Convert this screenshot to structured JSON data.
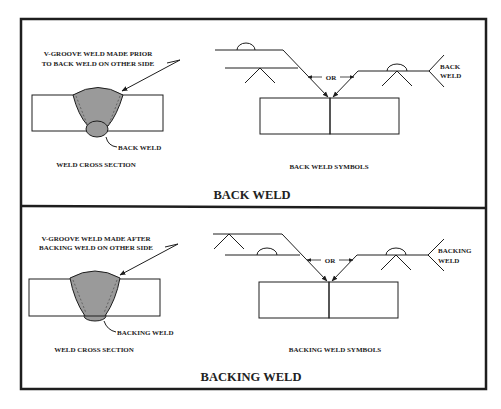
{
  "colors": {
    "line": "#1e1e1e",
    "weld_fill": "#9a9a9a",
    "background": "#ffffff"
  },
  "panels": [
    {
      "title": "BACK WELD",
      "cross_section": {
        "callout_line1": "V-GROOVE WELD MADE PRIOR",
        "callout_line2": "TO BACK WELD ON OTHER SIDE",
        "weld_label": "BACK WELD",
        "caption": "WELD CROSS SECTION"
      },
      "symbols": {
        "or_label": "OR",
        "tail_line1": "BACK",
        "tail_line2": "WELD",
        "caption": "BACK WELD SYMBOLS"
      }
    },
    {
      "title": "BACKING WELD",
      "cross_section": {
        "callout_line1": "V-GROOVE WELD MADE AFTER",
        "callout_line2": "BACKING WELD ON OTHER SIDE",
        "weld_label": "BACKING WELD",
        "caption": "WELD CROSS SECTION"
      },
      "symbols": {
        "or_label": "OR",
        "tail_line1": "BACKING",
        "tail_line2": "WELD",
        "caption": "BACKING WELD SYMBOLS"
      }
    }
  ]
}
